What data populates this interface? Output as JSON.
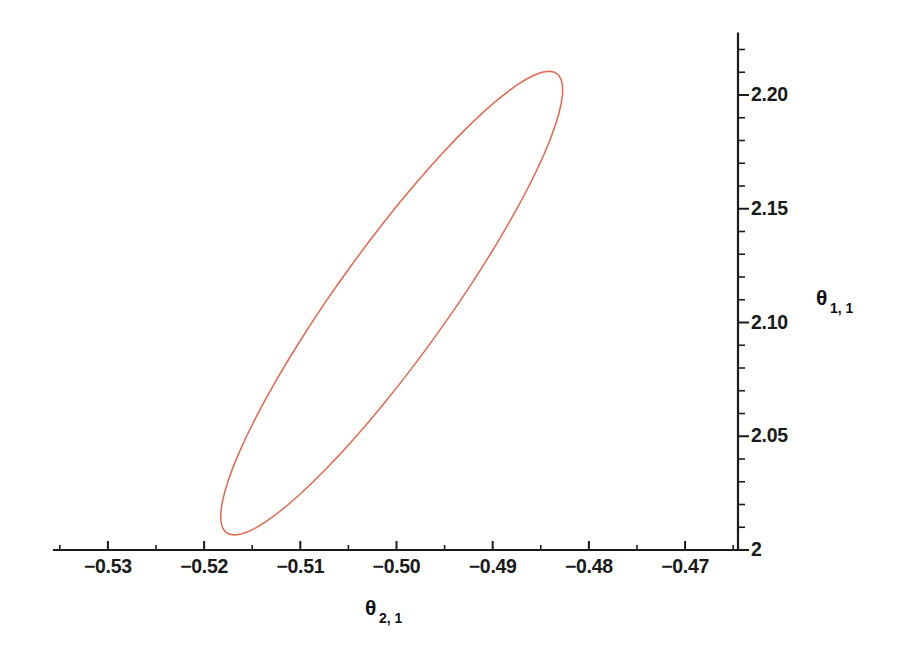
{
  "chart_data": {
    "type": "line",
    "title": "",
    "subtitle": "",
    "xlabel": "θ",
    "xlabel_sub": "2, 1",
    "ylabel": "θ",
    "ylabel_sub": "1, 1",
    "xlim": [
      -0.5355,
      -0.4645
    ],
    "ylim": [
      1.9925,
      2.2235
    ],
    "grid": false,
    "legend": "none",
    "series_color": "#e8654c",
    "axis_color": "#1b1b1b",
    "background": "#ffffff",
    "x_ticks": [
      -0.53,
      -0.52,
      -0.51,
      -0.5,
      -0.49,
      -0.48,
      -0.47
    ],
    "x_tick_labels": [
      "-0.53",
      "-0.52",
      "-0.51",
      "-0.50",
      "-0.49",
      "-0.48",
      "-0.47"
    ],
    "x_minor_step": 0.005,
    "y_ticks": [
      2.0,
      2.05,
      2.1,
      2.15,
      2.2
    ],
    "y_tick_labels": [
      "2",
      "2.05",
      "2.10",
      "2.15",
      "2.20"
    ],
    "y_minor_step": 0.01,
    "series": [
      {
        "name": "confidence-ellipse",
        "closed": true,
        "ellipse": {
          "center_x": -0.5005,
          "center_y": 2.1085,
          "semi_major": 0.1185,
          "semi_minor": 0.0205,
          "rotation_deg": 61.5,
          "note": "parametric ellipse in normalized (x-range, y-range) units; rendered as 72-segment polyline"
        },
        "x": [
          -0.4653,
          -0.4659,
          -0.4676,
          -0.4703,
          -0.4739,
          -0.4783,
          -0.4834,
          -0.4891,
          -0.4952,
          -0.5016,
          -0.5081,
          -0.5146,
          -0.5209,
          -0.5268,
          -0.5322,
          -0.5369,
          -0.5408,
          -0.5437,
          -0.5453,
          -0.5457,
          -0.5448,
          -0.5427,
          -0.5394,
          -0.5351,
          -0.5299,
          -0.524,
          -0.5176,
          -0.5109,
          -0.504,
          -0.4972,
          -0.4906,
          -0.4845,
          -0.479,
          -0.4743,
          -0.4706,
          -0.4677,
          -0.4658,
          -0.4653
        ],
        "y": [
          2.0215,
          2.0135,
          2.0067,
          2.0014,
          1.9977,
          1.9958,
          1.9957,
          1.9975,
          2.0011,
          2.0065,
          2.0135,
          2.022,
          2.0318,
          2.0427,
          2.0545,
          2.0669,
          2.0797,
          2.0926,
          2.1054,
          2.1178,
          2.1296,
          2.1406,
          2.1507,
          2.1596,
          2.1673,
          2.1736,
          2.1785,
          2.1819,
          2.1838,
          2.1841,
          2.1829,
          2.1803,
          2.1762,
          2.1709,
          2.1644,
          2.1569,
          2.1486,
          2.1396
        ]
      }
    ]
  },
  "axis_labels": {
    "x_axis_title": "θ",
    "x_axis_subscript": "2, 1",
    "y_axis_title": "θ",
    "y_axis_subscript": "1, 1"
  }
}
